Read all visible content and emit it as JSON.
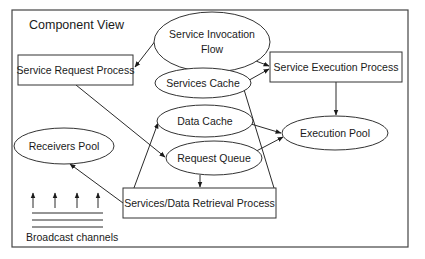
{
  "diagram": {
    "title": "Component View",
    "nodes": {
      "service_invocation_flow": {
        "line1": "Service Invocation",
        "line2": "Flow",
        "shape": "ellipse"
      },
      "service_request_process": {
        "label": "Service Request Process",
        "shape": "rect"
      },
      "services_cache": {
        "label": "Services Cache",
        "shape": "ellipse"
      },
      "service_execution_process": {
        "label": "Service Execution Process",
        "shape": "rect"
      },
      "data_cache": {
        "label": "Data Cache",
        "shape": "ellipse"
      },
      "execution_pool": {
        "label": "Execution Pool",
        "shape": "ellipse"
      },
      "receivers_pool": {
        "label": "Receivers Pool",
        "shape": "ellipse"
      },
      "request_queue": {
        "label": "Request Queue",
        "shape": "ellipse"
      },
      "services_data_retrieval_process": {
        "label": "Services/Data Retrieval Process",
        "shape": "rect"
      }
    },
    "broadcast": {
      "label": "Broadcast channels",
      "arrow_count": 4,
      "line_count": 3
    },
    "edges": [
      {
        "from": "Service Invocation Flow",
        "to": "Service Request Process",
        "directed": true
      },
      {
        "from": "Service Invocation Flow",
        "to": "Service Execution Process",
        "directed": true
      },
      {
        "from": "Services Cache",
        "to": "Service Execution Process",
        "directed": "both"
      },
      {
        "from": "Service Execution Process",
        "to": "Execution Pool",
        "directed": true
      },
      {
        "from": "Data Cache",
        "to": "Execution Pool",
        "directed": true
      },
      {
        "from": "Execution Pool",
        "to": "Request Queue",
        "directed": "both"
      },
      {
        "from": "Service Request Process",
        "to": "Request Queue",
        "directed": true
      },
      {
        "from": "Request Queue",
        "to": "Services/Data Retrieval Process",
        "directed": true
      },
      {
        "from": "Services/Data Retrieval Process",
        "to": "Receivers Pool",
        "directed": true
      },
      {
        "from": "Services/Data Retrieval Process",
        "to": "Data Cache",
        "directed": true
      },
      {
        "from": "Services/Data Retrieval Process",
        "to": "Services Cache",
        "directed": true
      }
    ],
    "colors": {
      "stroke": "#333333",
      "background": "#ffffff",
      "text": "#1a1a1a"
    }
  }
}
